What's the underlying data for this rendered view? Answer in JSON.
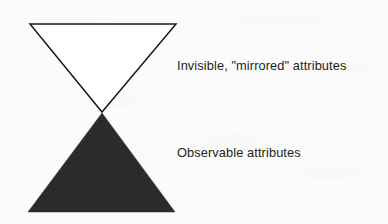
{
  "figure": {
    "name": "iceberg-attribute-diagram",
    "background_color": "#fbfbfb",
    "width": 388,
    "height": 224
  },
  "shapes": {
    "upper_triangle": {
      "icon": "inverted-triangle-outline-icon",
      "label": "inverted hollow triangle",
      "fill": "#ffffff",
      "stroke": "#1a1a1a",
      "stroke_width": 1.5,
      "points": "30,24 176,24 102,112"
    },
    "lower_triangle": {
      "icon": "triangle-filled-icon",
      "label": "upright filled triangle",
      "fill": "#2b2b2b",
      "stroke": "#2b2b2b",
      "stroke_width": 0.5,
      "points": "102,113 175,212 28,212"
    }
  },
  "labels": {
    "invisible": "Invisible, \"mirrored\" attributes",
    "observable": "Observable attributes"
  }
}
